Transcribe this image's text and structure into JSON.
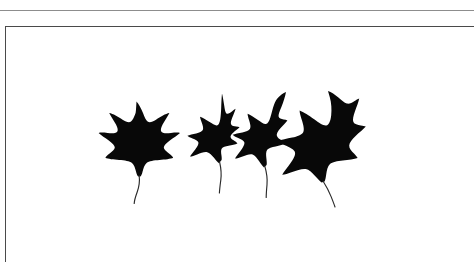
{
  "page": {
    "background_color": "#ffffff",
    "width": 474,
    "height": 262
  },
  "rules": {
    "top_rule": {
      "name": "top-hairline-rule",
      "color": "#8d8d8d",
      "y": 10
    }
  },
  "frame": {
    "name": "illustration-plate-frame",
    "border_color": "#4a4a4a",
    "fill_color": "#ffffff",
    "x": 5,
    "y": 26,
    "open_sides": "right-and-bottom"
  },
  "artwork": {
    "name": "leaf-silhouette-group",
    "caption": "",
    "ink_color": "#080808",
    "stem_color": "#2a2a2a",
    "count": 4,
    "leaves": [
      {
        "id": "leaf-1",
        "label": "five-lobed maple leaf",
        "lobes": 5,
        "orientation": "upright",
        "relative_size": "large"
      },
      {
        "id": "leaf-2",
        "label": "narrow three-lobed leaf",
        "lobes": 3,
        "orientation": "tilted-right",
        "relative_size": "medium"
      },
      {
        "id": "leaf-3",
        "label": "slender curled leaf",
        "lobes": 3,
        "orientation": "curled",
        "relative_size": "medium"
      },
      {
        "id": "leaf-4",
        "label": "broad three-lobed leaf",
        "lobes": 3,
        "orientation": "tilted-left",
        "relative_size": "large"
      }
    ]
  }
}
